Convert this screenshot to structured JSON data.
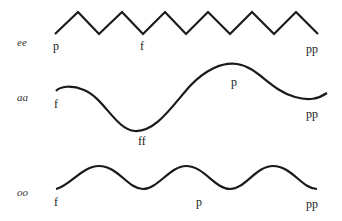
{
  "rows": [
    {
      "vowel": "ee",
      "shape": "zigzag",
      "dynamics": [
        {
          "label": "p",
          "x": 53,
          "y": 50
        },
        {
          "label": "f",
          "x": 140,
          "y": 50
        },
        {
          "label": "pp",
          "x": 306,
          "y": 53
        }
      ]
    },
    {
      "vowel": "aa",
      "shape": "single wave",
      "dynamics": [
        {
          "label": "f",
          "x": 54,
          "y": 108
        },
        {
          "label": "ff",
          "x": 138,
          "y": 145
        },
        {
          "label": "p",
          "x": 231,
          "y": 86
        },
        {
          "label": "pp",
          "x": 306,
          "y": 118
        }
      ]
    },
    {
      "vowel": "oo",
      "shape": "smooth sine",
      "dynamics": [
        {
          "label": "f",
          "x": 54,
          "y": 206
        },
        {
          "label": "p",
          "x": 196,
          "y": 206
        },
        {
          "label": "pp",
          "x": 306,
          "y": 208
        }
      ]
    }
  ],
  "colors": {
    "line": "#1a1a1a",
    "background": "#ffffff"
  }
}
